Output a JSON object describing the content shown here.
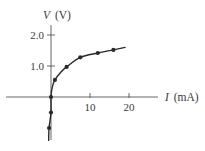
{
  "chart_data": {
    "type": "line",
    "title": "",
    "xlabel": "I (mA)",
    "ylabel": "V (V)",
    "xlabel_parts": {
      "symbol": "I",
      "unit": "(mA)"
    },
    "ylabel_parts": {
      "symbol": "V",
      "unit": "(V)"
    },
    "xlim": [
      -10,
      25
    ],
    "ylim": [
      -1.4,
      2.4
    ],
    "x_ticks": [
      10,
      20
    ],
    "x_tick_labels": [
      "10",
      "20"
    ],
    "y_ticks": [
      1.0,
      2.0
    ],
    "y_tick_labels": [
      "1.0",
      "2.0"
    ],
    "grid": false,
    "legend": null,
    "series": [
      {
        "name": "measured V-I characteristic",
        "markers": true,
        "points": [
          {
            "x": -0.5,
            "y": -1.0
          },
          {
            "x": 0.0,
            "y": -0.5
          },
          {
            "x": 0.0,
            "y": 0.0
          },
          {
            "x": 1.0,
            "y": 0.55
          },
          {
            "x": 4.0,
            "y": 0.97
          },
          {
            "x": 7.5,
            "y": 1.28
          },
          {
            "x": 12.0,
            "y": 1.42
          },
          {
            "x": 16.0,
            "y": 1.52
          }
        ],
        "curve": [
          {
            "x": -0.6,
            "y": -1.4
          },
          {
            "x": -0.5,
            "y": -1.0
          },
          {
            "x": 0.0,
            "y": -0.5
          },
          {
            "x": 0.0,
            "y": 0.0
          },
          {
            "x": 0.3,
            "y": 0.3
          },
          {
            "x": 1.0,
            "y": 0.55
          },
          {
            "x": 2.5,
            "y": 0.8
          },
          {
            "x": 4.0,
            "y": 0.97
          },
          {
            "x": 7.5,
            "y": 1.28
          },
          {
            "x": 12.0,
            "y": 1.42
          },
          {
            "x": 16.0,
            "y": 1.52
          },
          {
            "x": 19.0,
            "y": 1.6
          }
        ]
      }
    ]
  },
  "layout": {
    "origin_px": {
      "x": 51,
      "y": 97
    },
    "px_per_mA": 3.9,
    "px_per_V": 31,
    "x_axis_px": [
      6,
      158
    ],
    "y_axis_px": [
      25,
      140
    ],
    "line_color": "#2b2b2b",
    "axis_color": "#555555"
  }
}
